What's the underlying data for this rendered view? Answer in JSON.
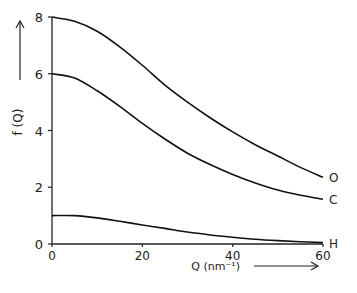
{
  "chart_data": {
    "type": "line",
    "title": "",
    "xlabel": "Q (nm⁻¹)",
    "ylabel": "f (Q)",
    "xlim": [
      0,
      60
    ],
    "ylim": [
      0,
      8
    ],
    "x_ticks": [
      0,
      20,
      40,
      60
    ],
    "y_ticks": [
      0,
      2,
      4,
      6,
      8
    ],
    "x_tick_labels": [
      "0",
      "20",
      "40",
      "60"
    ],
    "y_tick_labels": [
      "0",
      "2",
      "4",
      "6",
      "8"
    ],
    "grid": false,
    "legend": "curve end labels",
    "x": [
      0,
      5,
      10,
      15,
      20,
      25,
      30,
      35,
      40,
      45,
      50,
      55,
      60
    ],
    "series": [
      {
        "name": "O",
        "values": [
          8.0,
          7.85,
          7.5,
          6.95,
          6.3,
          5.6,
          5.0,
          4.45,
          3.95,
          3.5,
          3.1,
          2.7,
          2.35
        ]
      },
      {
        "name": "C",
        "values": [
          6.0,
          5.85,
          5.4,
          4.85,
          4.25,
          3.7,
          3.2,
          2.8,
          2.45,
          2.15,
          1.9,
          1.72,
          1.58
        ]
      },
      {
        "name": "H",
        "values": [
          1.0,
          1.0,
          0.92,
          0.8,
          0.67,
          0.55,
          0.42,
          0.32,
          0.24,
          0.17,
          0.12,
          0.08,
          0.05
        ]
      }
    ]
  },
  "axes": {
    "x_label": "Q (nm⁻¹)",
    "y_label": "f (Q)",
    "x_arrow": "→",
    "y_arrow": "↑"
  }
}
